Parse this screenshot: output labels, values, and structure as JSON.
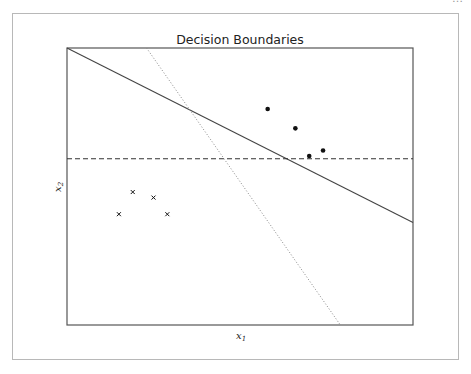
{
  "figure": {
    "top_strip_text": "…"
  },
  "chart_data": {
    "type": "scatter",
    "title": "Decision Boundaries",
    "xlabel": "x1",
    "ylabel": "x2",
    "xlabel_main": "x",
    "xlabel_sub": "1",
    "ylabel_main": "x",
    "ylabel_sub": "2",
    "grid": false,
    "ticks": false,
    "axis_ranges_note": "no tick labels shown; coordinates given in normalized plot units [0,1] (x right, y up)",
    "xlim": [
      0,
      1
    ],
    "ylim": [
      0,
      1
    ],
    "series": [
      {
        "name": "class-positive",
        "marker": "dot",
        "color": "#111111",
        "points": [
          [
            0.58,
            0.78
          ],
          [
            0.66,
            0.71
          ],
          [
            0.7,
            0.61
          ],
          [
            0.74,
            0.63
          ]
        ]
      },
      {
        "name": "class-negative",
        "marker": "x",
        "color": "#111111",
        "points": [
          [
            0.19,
            0.48
          ],
          [
            0.25,
            0.46
          ],
          [
            0.15,
            0.4
          ],
          [
            0.29,
            0.4
          ]
        ]
      }
    ],
    "lines": [
      {
        "name": "boundary-solid",
        "style": "solid",
        "color": "#444444",
        "from": [
          0.0,
          1.0
        ],
        "to": [
          1.0,
          0.37
        ]
      },
      {
        "name": "boundary-dashed",
        "style": "dashed",
        "color": "#333333",
        "from": [
          0.0,
          0.6
        ],
        "to": [
          1.0,
          0.6
        ]
      },
      {
        "name": "boundary-dotted",
        "style": "dotted",
        "color": "#888888",
        "from": [
          0.23,
          1.0
        ],
        "to": [
          0.79,
          0.0
        ]
      }
    ]
  }
}
